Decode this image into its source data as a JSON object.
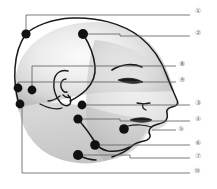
{
  "figure": {
    "type": "anatomical-diagram",
    "orientation": "right-facing lateral profile",
    "style": {
      "line_color": "#1a1a1a",
      "leader_line_color": "#5a5a5a",
      "label_color": "#6d6d6d",
      "point_color": "#111111",
      "skull_fill_light": "#f2f2f2",
      "skull_fill_mid": "#d8d8d8",
      "face_fill": "#cccccc",
      "background": "#ffffff",
      "border_color": "#8a8a8a"
    },
    "labels": [
      {
        "id": "1",
        "glyph": "①",
        "x": 198,
        "y": 12,
        "leader_from_x": 26,
        "leader_from_y": 34,
        "elbow_y": 15
      },
      {
        "id": "2",
        "glyph": "②",
        "x": 198,
        "y": 33,
        "leader_from_x": 83,
        "leader_from_y": 34,
        "elbow_y": 36
      },
      {
        "id": "8",
        "glyph": "⑧",
        "x": 182,
        "y": 63,
        "leader_from_x": 32,
        "leader_from_y": 90,
        "elbow_y": 66
      },
      {
        "id": "9",
        "glyph": "⑨",
        "x": 182,
        "y": 79,
        "leader_from_x": 18,
        "leader_from_y": 88,
        "elbow_y": 82
      },
      {
        "id": "3",
        "glyph": "③",
        "x": 198,
        "y": 103,
        "leader_from_x": 82,
        "leader_from_y": 105,
        "elbow_y": 106
      },
      {
        "id": "4",
        "glyph": "④",
        "x": 198,
        "y": 120,
        "leader_from_x": 78,
        "leader_from_y": 119,
        "elbow_y": 122
      },
      {
        "id": "5",
        "glyph": "⑤",
        "x": 180,
        "y": 130,
        "leader_from_x": 122,
        "leader_from_y": 126,
        "elbow_y": 131
      },
      {
        "id": "6",
        "glyph": "⑥",
        "x": 198,
        "y": 143,
        "leader_from_x": 95,
        "leader_from_y": 145,
        "elbow_y": 146
      },
      {
        "id": "7",
        "glyph": "⑦",
        "x": 198,
        "y": 158,
        "leader_from_x": 78,
        "leader_from_y": 155,
        "elbow_y": 158
      },
      {
        "id": "10",
        "glyph": "⑩",
        "x": 197,
        "y": 172,
        "leader_from_x": 22,
        "leader_from_y": 104,
        "elbow_y": 173
      }
    ],
    "points": [
      {
        "id": "1",
        "x": 26,
        "y": 34,
        "r": 4.6,
        "region": "frontal-superior-left"
      },
      {
        "id": "2",
        "x": 83,
        "y": 34,
        "r": 5.0,
        "region": "vertex-parietal"
      },
      {
        "id": "9",
        "x": 18,
        "y": 88,
        "r": 4.4,
        "region": "occipital-upper"
      },
      {
        "id": "8",
        "x": 32,
        "y": 90,
        "r": 4.4,
        "region": "occipital-lateral"
      },
      {
        "id": "10",
        "x": 22,
        "y": 104,
        "r": 4.4,
        "region": "occipital-lower"
      },
      {
        "id": "3",
        "x": 82,
        "y": 105,
        "r": 4.4,
        "region": "zygomatic-cheek"
      },
      {
        "id": "4",
        "x": 78,
        "y": 119,
        "r": 4.6,
        "region": "mandibular-angle-upper"
      },
      {
        "id": "5",
        "x": 122,
        "y": 126,
        "r": 4.6,
        "region": "mentolabial-chin"
      },
      {
        "id": "6",
        "x": 95,
        "y": 145,
        "r": 4.6,
        "region": "submandibular"
      },
      {
        "id": "7",
        "x": 78,
        "y": 155,
        "r": 5.0,
        "region": "submental-neck"
      }
    ],
    "bracket": {
      "top_y": 15,
      "bottom_y": 173,
      "left_x": 22,
      "right_x": 190
    }
  }
}
